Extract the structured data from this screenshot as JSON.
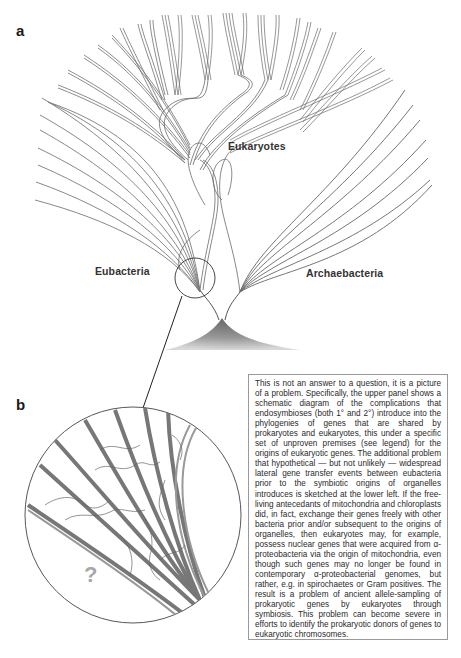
{
  "figure": {
    "panel_a_label": "a",
    "panel_b_label": "b",
    "tree_labels": {
      "eukaryotes": "Eukaryotes",
      "eubacteria": "Eubacteria",
      "archaebacteria": "Archaebacteria"
    },
    "question_mark": "?",
    "colors": {
      "line": "#6e6e6e",
      "dark_line": "#4a4a4a",
      "root_fill": "#8a8a8a",
      "box_border": "#9a9a9a"
    }
  },
  "legend_box": {
    "text": "This is not an answer to a question, it is a picture of a problem. Specifically, the upper panel shows a schematic diagram of the complications that endosymbioses (both 1° and 2°) introduce into the phylogenies of genes that are shared by prokaryotes and eukaryotes, this under a specific set of unproven premises (see legend) for the origins of eukaryotic genes. The additional problem that hypothetical — but not unlikely — widespread lateral gene transfer events between eubacteria prior to the symbiotic origins of organelles introduces is sketched at the lower left. If the free-living antecedants of mitochondria and chloroplasts did, in fact, exchange their genes freely with other bacteria prior and/or subsequent to the origins of organelles, then eukaryotes may, for example, possess nuclear genes that were acquired from α-proteobacteria via the origin of mitochondria, even though such genes may no longer be found in contemporary α-proteobacterial genomes, but rather, e.g. in spirochaetes or Gram positives. The result is a problem of ancient allele-sampling of prokaryotic genes by eukaryotes through symbiosis. This problem can become severe in efforts to identify the prokaryotic donors of genes to eukaryotic chromosomes."
  }
}
